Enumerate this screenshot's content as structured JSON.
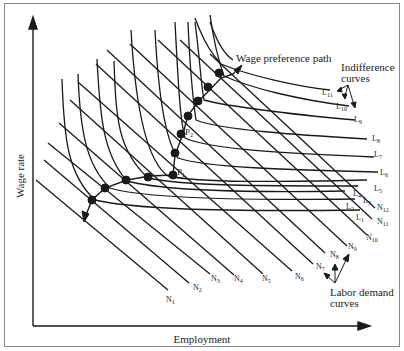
{
  "axes": {
    "x_label": "Employment",
    "y_label": "Wage rate"
  },
  "annotations": {
    "wage_path": "Wage preference path",
    "indiff_line1": "Indifference",
    "indiff_line2": "curves",
    "demand_line1": "Labor demand",
    "demand_line2": "curves",
    "p1": "P",
    "p1_sub": "1",
    "p2": "P",
    "p2_sub": "2"
  },
  "indifference_labels": [
    {
      "base": "L",
      "sub": "11"
    },
    {
      "base": "L",
      "sub": "10"
    },
    {
      "base": "L",
      "sub": "9"
    },
    {
      "base": "L",
      "sub": "8"
    },
    {
      "base": "L",
      "sub": "7"
    },
    {
      "base": "L",
      "sub": "6"
    },
    {
      "base": "L",
      "sub": "5"
    },
    {
      "base": "L",
      "sub": "4"
    },
    {
      "base": "L",
      "sub": "3"
    },
    {
      "base": "L",
      "sub": "2"
    },
    {
      "base": "L",
      "sub": "1"
    }
  ],
  "demand_labels": [
    {
      "base": "N",
      "sub": "1"
    },
    {
      "base": "N",
      "sub": "2"
    },
    {
      "base": "N",
      "sub": "3"
    },
    {
      "base": "N",
      "sub": "4"
    },
    {
      "base": "N",
      "sub": "5"
    },
    {
      "base": "N",
      "sub": "6"
    },
    {
      "base": "N",
      "sub": "7"
    },
    {
      "base": "N",
      "sub": "8"
    },
    {
      "base": "N",
      "sub": "9"
    },
    {
      "base": "N",
      "sub": "10"
    },
    {
      "base": "N",
      "sub": "11"
    },
    {
      "base": "N",
      "sub": "12"
    }
  ],
  "colors": {
    "ink": "#1a1a1a",
    "frame": "#888888",
    "background": "#ffffff"
  }
}
